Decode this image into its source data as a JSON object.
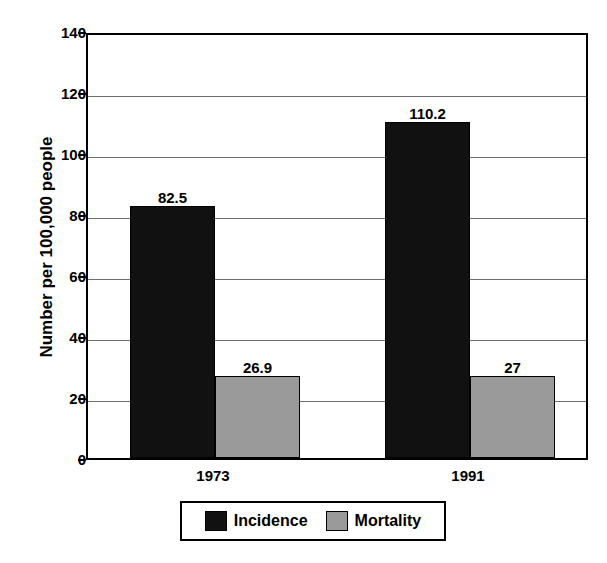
{
  "chart_data": {
    "type": "bar",
    "title": "",
    "xlabel": "",
    "ylabel": "Number per 100,000 people",
    "categories": [
      "1973",
      "1991"
    ],
    "series": [
      {
        "name": "Incidence",
        "color": "#111111",
        "values": [
          82.5,
          110.2
        ],
        "labels": [
          "82.5",
          "110.2"
        ]
      },
      {
        "name": "Mortality",
        "color": "#9a9a9a",
        "values": [
          26.9,
          27
        ],
        "labels": [
          "26.9",
          "27"
        ]
      }
    ],
    "ylim": [
      0,
      140
    ],
    "yticks": [
      0,
      20,
      40,
      60,
      80,
      100,
      120,
      140
    ],
    "ytick_labels": [
      "0",
      "20",
      "40",
      "60",
      "80",
      "100",
      "120",
      "140"
    ],
    "grid": true,
    "grid_axis": "y",
    "legend_position": "bottom-center"
  },
  "axis": {
    "y_title": "Number per 100,000 people"
  },
  "legend": {
    "entries": [
      {
        "label": "Incidence"
      },
      {
        "label": "Mortality"
      }
    ]
  }
}
